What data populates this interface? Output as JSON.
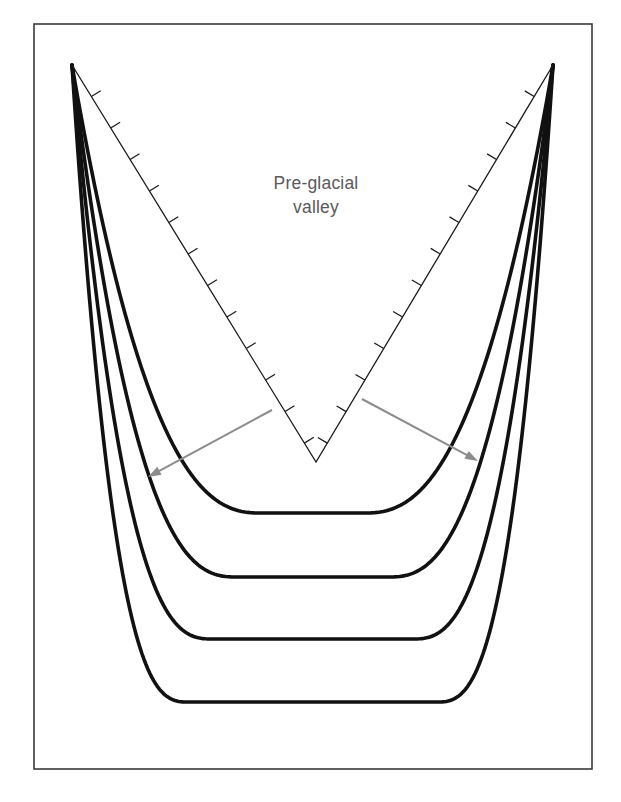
{
  "figure": {
    "background_color": "#ffffff",
    "frame": {
      "name": "figure-border",
      "x": 34,
      "y": 24,
      "width": 558,
      "height": 745,
      "stroke_color": "#3a3a3a",
      "stroke_width": 1.6,
      "fill": "none"
    },
    "label": {
      "line1": "Pre-glacial",
      "line2": "valley",
      "color": "#5a5a5a",
      "x": 316,
      "y_line1": 189,
      "y_line2": 213,
      "font_size": 17.5
    },
    "preglacial_valley": {
      "name": "pre-glacial-v-profile",
      "stroke_color": "#1a1a1a",
      "stroke_width": 1.3,
      "apex_left": {
        "x": 72,
        "y": 65
      },
      "apex_right": {
        "x": 553,
        "y": 65
      },
      "bottom": {
        "x": 316,
        "y": 462
      },
      "hachure_tick_length": 11,
      "hachure_count_per_side": 12,
      "hachure_note": "short perpendicular ticks on the valley-interior side of each V limb"
    },
    "erosion_curves": {
      "name": "glacial-erosion-profiles",
      "count": 4,
      "stroke_color": "#111111",
      "description": "Successively wider and deeper U-shaped profiles produced by glacial erosion, all converging at the two upper apexes.",
      "profiles": [
        {
          "index": 1,
          "label": "stage-1",
          "bottom_y": 513,
          "half_width_at_bottom": 52,
          "stroke_width": 3.6
        },
        {
          "index": 2,
          "label": "stage-2",
          "bottom_y": 577,
          "half_width_at_bottom": 76,
          "stroke_width": 3.6
        },
        {
          "index": 3,
          "label": "stage-3",
          "bottom_y": 639,
          "half_width_at_bottom": 100,
          "stroke_width": 3.6
        },
        {
          "index": 4,
          "label": "stage-4",
          "bottom_y": 702,
          "half_width_at_bottom": 124,
          "stroke_width": 3.6
        }
      ]
    },
    "arrows": {
      "name": "erosion-direction-arrows",
      "color": "#8c8c8c",
      "stroke_width": 2.0,
      "head_length": 13,
      "head_width": 9,
      "items": [
        {
          "name": "arrow-left",
          "from": {
            "x": 272,
            "y": 410
          },
          "to": {
            "x": 148,
            "y": 477
          },
          "direction": "outward-left-downward"
        },
        {
          "name": "arrow-right",
          "from": {
            "x": 362,
            "y": 399
          },
          "to": {
            "x": 478,
            "y": 461
          },
          "direction": "outward-right-downward"
        }
      ]
    }
  },
  "chart_data": {
    "type": "line",
    "xlabel": "",
    "ylabel": "",
    "annotations": [
      "Pre-glacial valley"
    ],
    "series": [
      {
        "name": "Pre-glacial V-shaped valley",
        "style": "thin line with hachures",
        "apex_y": 65,
        "floor_y": 462,
        "floor_x": 316
      },
      {
        "name": "Erosion profile 1",
        "style": "thick U curve",
        "floor_y": 513
      },
      {
        "name": "Erosion profile 2",
        "style": "thick U curve",
        "floor_y": 577
      },
      {
        "name": "Erosion profile 3",
        "style": "thick U curve",
        "floor_y": 639
      },
      {
        "name": "Erosion profile 4",
        "style": "thick U curve",
        "floor_y": 702
      }
    ],
    "legend": "none",
    "grid": false
  }
}
